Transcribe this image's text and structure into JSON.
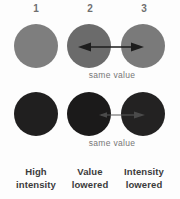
{
  "figure": {
    "background": "#fdfdfd"
  },
  "columns": [
    {
      "number": "1",
      "caption_line1": "High",
      "caption_line2": "intensity"
    },
    {
      "number": "2",
      "caption_line1": "Value",
      "caption_line2": "lowered"
    },
    {
      "number": "3",
      "caption_line1": "Intensity",
      "caption_line2": "lowered"
    }
  ],
  "rows": [
    {
      "name": "light-row",
      "swatches": [
        {
          "label": "light-reference",
          "color": "#7e7e7e"
        },
        {
          "label": "light-value-lowered",
          "color": "#6b6b6b"
        },
        {
          "label": "light-intensity-lowered",
          "color": "#7a7a7a"
        }
      ],
      "connector": {
        "label": "same value",
        "style": "double-headed-arrow",
        "color": "#1d1d1d"
      }
    },
    {
      "name": "dark-row",
      "swatches": [
        {
          "label": "dark-reference",
          "color": "#201f1f"
        },
        {
          "label": "dark-value-lowered",
          "color": "#1b1a1a"
        },
        {
          "label": "dark-intensity-lowered",
          "color": "#232222"
        }
      ],
      "connector": {
        "label": "same value",
        "style": "double-headed-arrow",
        "color": "#3a3a3a"
      }
    }
  ],
  "labels": {
    "same_value_top": "same value",
    "same_value_bottom": "same value"
  },
  "colors": {
    "number_text": "#6f6f6f",
    "caption_text": "#3b3b3b",
    "annotation_text": "#777777"
  }
}
